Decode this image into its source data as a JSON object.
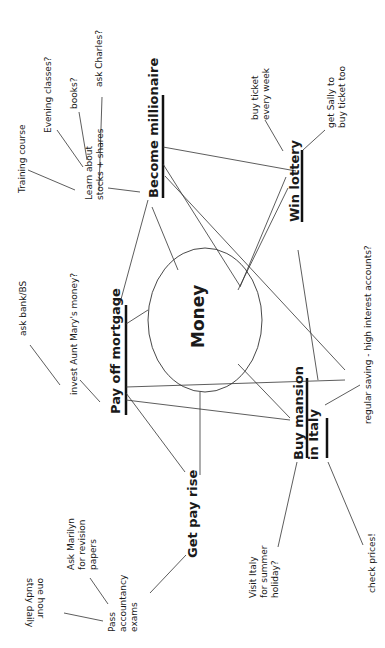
{
  "center": {
    "label": "Money"
  },
  "branches": [
    {
      "id": "become-millionaire",
      "label": "Become millionaire",
      "children": [
        {
          "label": "Learn about stocks + shares",
          "lines": [
            "Learn about",
            "stocks + shares"
          ],
          "children": [
            {
              "label": "Training course"
            },
            {
              "label": "Evening classes?"
            },
            {
              "label": "books?"
            },
            {
              "label": "ask Charles?"
            }
          ]
        }
      ]
    },
    {
      "id": "win-lottery",
      "label": "Win lottery",
      "children": [
        {
          "label": "buy ticket every week",
          "lines": [
            "buy ticket",
            "every week"
          ]
        },
        {
          "label": "get Sally to buy ticket too",
          "lines": [
            "get Sally to",
            "buy ticket too"
          ]
        }
      ]
    },
    {
      "id": "pay-off-mortgage",
      "label": "Pay off mortgage",
      "children": [
        {
          "label": "invest Aunt Mary's money?",
          "children": [
            {
              "label": "ask bank/BS"
            }
          ]
        }
      ]
    },
    {
      "id": "buy-mansion",
      "label": "Buy mansion in Italy",
      "lines": [
        "Buy mansion",
        "in Italy"
      ],
      "children": [
        {
          "label": "Visit Italy for summer holiday?",
          "lines": [
            "Visit Italy",
            "for summer",
            "holiday?"
          ]
        },
        {
          "label": "check prices!"
        },
        {
          "label": "regular saving - high interest accounts?"
        }
      ]
    },
    {
      "id": "get-pay-rise",
      "label": "Get pay rise",
      "children": [
        {
          "label": "Pass accountancy exams",
          "lines": [
            "Pass",
            "accountancy",
            "exams"
          ],
          "children": [
            {
              "label": "Ask Marilyn for revision papers",
              "lines": [
                "Ask Marilyn",
                "for revision",
                "papers"
              ]
            },
            {
              "label": "one hour study daily",
              "lines": [
                "one hour",
                "study daily"
              ]
            }
          ]
        }
      ]
    }
  ]
}
